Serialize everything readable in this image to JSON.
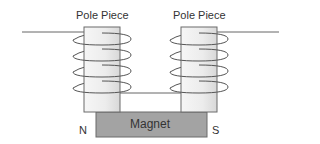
{
  "diagram": {
    "title_left": "Pole Piece",
    "title_right": "Pole Piece",
    "magnet_label": "Magnet",
    "north_label": "N",
    "south_label": "S",
    "colors": {
      "pole_piece_fill_light": "#f4f4f4",
      "pole_piece_fill_dark": "#dcdcdc",
      "magnet_fill": "#a3a3a3",
      "stroke": "#555555",
      "wire": "#666666"
    },
    "coil_turns_per_pole": 4
  }
}
